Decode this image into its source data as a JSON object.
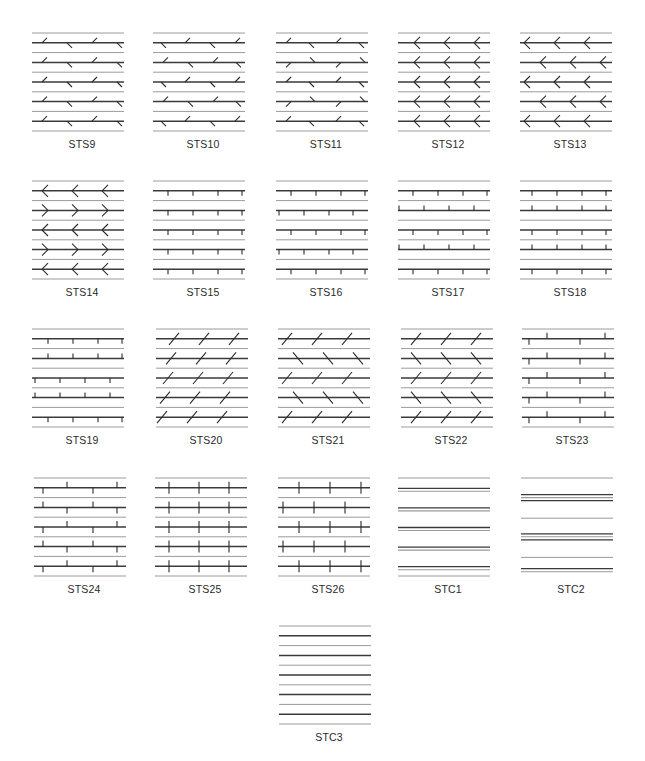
{
  "figure": {
    "panel_width": 92,
    "line_spacing": 9.8,
    "line_count": 11,
    "colors": {
      "thin_line": "#9a9a9a",
      "thick_line": "#3a3a3a",
      "marker": "#2a2a2a",
      "label": "#2a2a2a"
    },
    "panels": [
      {
        "id": "STS9",
        "label": "STS9",
        "x": 32,
        "y": 33,
        "pattern": "sts9"
      },
      {
        "id": "STS10",
        "label": "STS10",
        "x": 153,
        "y": 33,
        "pattern": "sts10"
      },
      {
        "id": "STS11",
        "label": "STS11",
        "x": 276,
        "y": 33,
        "pattern": "sts11"
      },
      {
        "id": "STS12",
        "label": "STS12",
        "x": 398,
        "y": 33,
        "pattern": "sts12"
      },
      {
        "id": "STS13",
        "label": "STS13",
        "x": 520,
        "y": 33,
        "pattern": "sts13"
      },
      {
        "id": "STS14",
        "label": "STS14",
        "x": 32,
        "y": 181,
        "pattern": "sts14"
      },
      {
        "id": "STS15",
        "label": "STS15",
        "x": 153,
        "y": 181,
        "pattern": "sts15"
      },
      {
        "id": "STS16",
        "label": "STS16",
        "x": 276,
        "y": 181,
        "pattern": "sts16"
      },
      {
        "id": "STS17",
        "label": "STS17",
        "x": 398,
        "y": 181,
        "pattern": "sts17"
      },
      {
        "id": "STS18",
        "label": "STS18",
        "x": 520,
        "y": 181,
        "pattern": "sts18"
      },
      {
        "id": "STS19",
        "label": "STS19",
        "x": 32,
        "y": 329,
        "pattern": "sts19"
      },
      {
        "id": "STS20",
        "label": "STS20",
        "x": 156,
        "y": 329,
        "pattern": "sts20"
      },
      {
        "id": "STS21",
        "label": "STS21",
        "x": 278,
        "y": 329,
        "pattern": "sts21"
      },
      {
        "id": "STS22",
        "label": "STS22",
        "x": 401,
        "y": 329,
        "pattern": "sts22"
      },
      {
        "id": "STS23",
        "label": "STS23",
        "x": 522,
        "y": 329,
        "pattern": "sts23"
      },
      {
        "id": "STS24",
        "label": "STS24",
        "x": 34,
        "y": 478,
        "pattern": "sts24"
      },
      {
        "id": "STS25",
        "label": "STS25",
        "x": 155,
        "y": 478,
        "pattern": "sts25"
      },
      {
        "id": "STS26",
        "label": "STS26",
        "x": 278,
        "y": 478,
        "pattern": "sts26"
      },
      {
        "id": "STC1",
        "label": "STC1",
        "x": 398,
        "y": 478,
        "pattern": "stc1"
      },
      {
        "id": "STC2",
        "label": "STC2",
        "x": 521,
        "y": 478,
        "pattern": "stc2"
      },
      {
        "id": "STC3",
        "label": "STC3",
        "x": 279,
        "y": 626,
        "pattern": "stc3"
      }
    ]
  }
}
